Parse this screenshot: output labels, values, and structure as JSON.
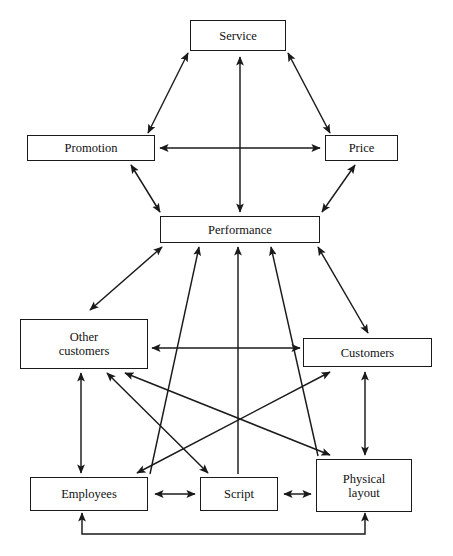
{
  "diagram": {
    "type": "relationship-network-diagram",
    "background_color": "#ffffff",
    "line_color": "#1a1a1a",
    "text_color": "#111111",
    "nodes": [
      {
        "id": "service",
        "label": "Service",
        "x": 190,
        "y": 20,
        "w": 96,
        "h": 31
      },
      {
        "id": "promotion",
        "label": "Promotion",
        "x": 27,
        "y": 135,
        "w": 128,
        "h": 26
      },
      {
        "id": "price",
        "label": "Price",
        "x": 325,
        "y": 135,
        "w": 73,
        "h": 26
      },
      {
        "id": "performance",
        "label": "Performance",
        "x": 160,
        "y": 216,
        "w": 160,
        "h": 27
      },
      {
        "id": "other_customers",
        "label": "Other\ncustomers",
        "x": 20,
        "y": 319,
        "w": 128,
        "h": 50
      },
      {
        "id": "customers",
        "label": "Customers",
        "x": 303,
        "y": 338,
        "w": 129,
        "h": 29
      },
      {
        "id": "employees",
        "label": "Employees",
        "x": 30,
        "y": 477,
        "w": 118,
        "h": 34
      },
      {
        "id": "script",
        "label": "Script",
        "x": 200,
        "y": 477,
        "w": 78,
        "h": 34
      },
      {
        "id": "physical_layout",
        "label": "Physical\nlayout",
        "x": 316,
        "y": 459,
        "w": 96,
        "h": 53
      }
    ],
    "edges": [
      {
        "from": "promotion",
        "to": "service",
        "arrows": "both",
        "kind": "straight"
      },
      {
        "from": "service",
        "to": "price",
        "arrows": "both",
        "kind": "straight"
      },
      {
        "from": "service",
        "to": "performance",
        "arrows": "both",
        "kind": "straight"
      },
      {
        "from": "promotion",
        "to": "price",
        "arrows": "both",
        "kind": "straight"
      },
      {
        "from": "promotion",
        "to": "performance",
        "arrows": "both",
        "kind": "straight"
      },
      {
        "from": "price",
        "to": "performance",
        "arrows": "both",
        "kind": "straight"
      },
      {
        "from": "other_customers",
        "to": "performance",
        "arrows": "both",
        "kind": "straight"
      },
      {
        "from": "customers",
        "to": "performance",
        "arrows": "both",
        "kind": "straight"
      },
      {
        "from": "employees",
        "to": "performance",
        "arrows": "end",
        "kind": "straight"
      },
      {
        "from": "script",
        "to": "performance",
        "arrows": "end",
        "kind": "straight"
      },
      {
        "from": "physical_layout",
        "to": "performance",
        "arrows": "end",
        "kind": "straight"
      },
      {
        "from": "customers",
        "to": "other_customers",
        "arrows": "both",
        "kind": "straight"
      },
      {
        "from": "other_customers",
        "to": "employees",
        "arrows": "both",
        "kind": "straight"
      },
      {
        "from": "other_customers",
        "to": "script",
        "arrows": "both",
        "kind": "straight"
      },
      {
        "from": "other_customers",
        "to": "physical_layout",
        "arrows": "both",
        "kind": "straight"
      },
      {
        "from": "customers",
        "to": "employees",
        "arrows": "both",
        "kind": "straight"
      },
      {
        "from": "customers",
        "to": "physical_layout",
        "arrows": "both",
        "kind": "straight"
      },
      {
        "from": "employees",
        "to": "script",
        "arrows": "both",
        "kind": "straight"
      },
      {
        "from": "script",
        "to": "physical_layout",
        "arrows": "both",
        "kind": "straight"
      },
      {
        "from": "employees",
        "to": "physical_layout",
        "arrows": "both",
        "kind": "bottom-loop"
      }
    ],
    "lines": [
      {
        "name": "promotion-service-line",
        "x1": 148,
        "y1": 133,
        "x2": 188,
        "y2": 53,
        "head_start": true,
        "head_end": true
      },
      {
        "name": "service-price-line",
        "x1": 288,
        "y1": 53,
        "x2": 330,
        "y2": 133,
        "head_start": true,
        "head_end": true
      },
      {
        "name": "service-performance-line",
        "x1": 240,
        "y1": 57,
        "x2": 240,
        "y2": 212,
        "head_start": true,
        "head_end": true
      },
      {
        "name": "promotion-price-line",
        "x1": 160,
        "y1": 148,
        "x2": 320,
        "y2": 148,
        "head_start": true,
        "head_end": true
      },
      {
        "name": "promotion-performance-line",
        "x1": 131,
        "y1": 165,
        "x2": 160,
        "y2": 212,
        "head_start": true,
        "head_end": true
      },
      {
        "name": "price-performance-line",
        "x1": 355,
        "y1": 165,
        "x2": 322,
        "y2": 212,
        "head_start": true,
        "head_end": true
      },
      {
        "name": "othercustomers-performance-line",
        "x1": 90,
        "y1": 310,
        "x2": 162,
        "y2": 247,
        "head_start": true,
        "head_end": true
      },
      {
        "name": "customers-performance-line",
        "x1": 368,
        "y1": 333,
        "x2": 318,
        "y2": 247,
        "head_start": true,
        "head_end": true
      },
      {
        "name": "employees-performance-line",
        "x1": 150,
        "y1": 474,
        "x2": 199,
        "y2": 247,
        "head_start": false,
        "head_end": true
      },
      {
        "name": "script-performance-line",
        "x1": 238,
        "y1": 474,
        "x2": 238,
        "y2": 247,
        "head_start": false,
        "head_end": true
      },
      {
        "name": "physicallayout-performance-line",
        "x1": 318,
        "y1": 456,
        "x2": 271,
        "y2": 247,
        "head_start": false,
        "head_end": true
      },
      {
        "name": "othercustomers-customers-line",
        "x1": 152,
        "y1": 348,
        "x2": 300,
        "y2": 348,
        "head_start": true,
        "head_end": true
      },
      {
        "name": "othercustomers-employees-line",
        "x1": 81,
        "y1": 373,
        "x2": 81,
        "y2": 473,
        "head_start": true,
        "head_end": true
      },
      {
        "name": "othercustomers-script-line",
        "x1": 107,
        "y1": 373,
        "x2": 208,
        "y2": 473,
        "head_start": true,
        "head_end": true
      },
      {
        "name": "othercustomers-physicallayout-line",
        "x1": 125,
        "y1": 373,
        "x2": 330,
        "y2": 455,
        "head_start": true,
        "head_end": true
      },
      {
        "name": "customers-employees-line",
        "x1": 330,
        "y1": 372,
        "x2": 137,
        "y2": 473,
        "head_start": true,
        "head_end": true
      },
      {
        "name": "customers-physicallayout-line",
        "x1": 365,
        "y1": 372,
        "x2": 365,
        "y2": 455,
        "head_start": true,
        "head_end": true
      },
      {
        "name": "employees-script-line",
        "x1": 155,
        "y1": 494,
        "x2": 195,
        "y2": 494,
        "head_start": true,
        "head_end": true
      },
      {
        "name": "script-physicallayout-line",
        "x1": 284,
        "y1": 494,
        "x2": 311,
        "y2": 494,
        "head_start": true,
        "head_end": true
      }
    ],
    "loop": {
      "name": "employees-physicallayout-feedback-loop",
      "left_x": 82,
      "right_x": 365,
      "top_y": 513,
      "bottom_y": 534
    }
  }
}
